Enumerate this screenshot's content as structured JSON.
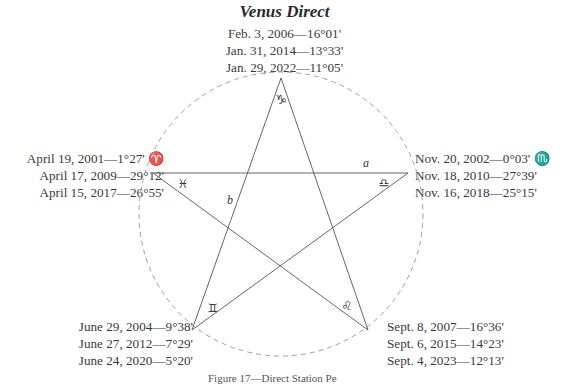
{
  "title": "Venus Direct",
  "labels": {
    "top": [
      "Feb. 3, 2006—16°01'",
      "Jan. 31, 2014—13°33'",
      "Jan. 29, 2022—11°05'"
    ],
    "left": [
      "April 19, 2001—1°27' ♈",
      "April 17, 2009—29°12'",
      "April 15, 2017—26°55'"
    ],
    "right": [
      "Nov. 20, 2002—0°03' ♏",
      "Nov. 18, 2010—27°39'",
      "Nov. 16, 2018—25°15'"
    ],
    "bottom_left": [
      "June 29, 2004—9°38'",
      "June 27, 2012—7°29'",
      "June 24, 2020—5°20'"
    ],
    "bottom_right": [
      "Sept. 8, 2007—16°36'",
      "Sept. 6, 2015—14°23'",
      "Sept. 4, 2023—12°13'"
    ]
  },
  "vertex_signs": {
    "top": "♑",
    "left": "♓",
    "right": "♎",
    "bottom_left": "♊",
    "bottom_right": "♌"
  },
  "segment_labels": {
    "a": "a",
    "b": "b"
  },
  "caption": "Figure 17—Direct Station Pe",
  "colors": {
    "line": "#555555",
    "circle": "#9a9a9a",
    "text": "#3a3a3a"
  }
}
